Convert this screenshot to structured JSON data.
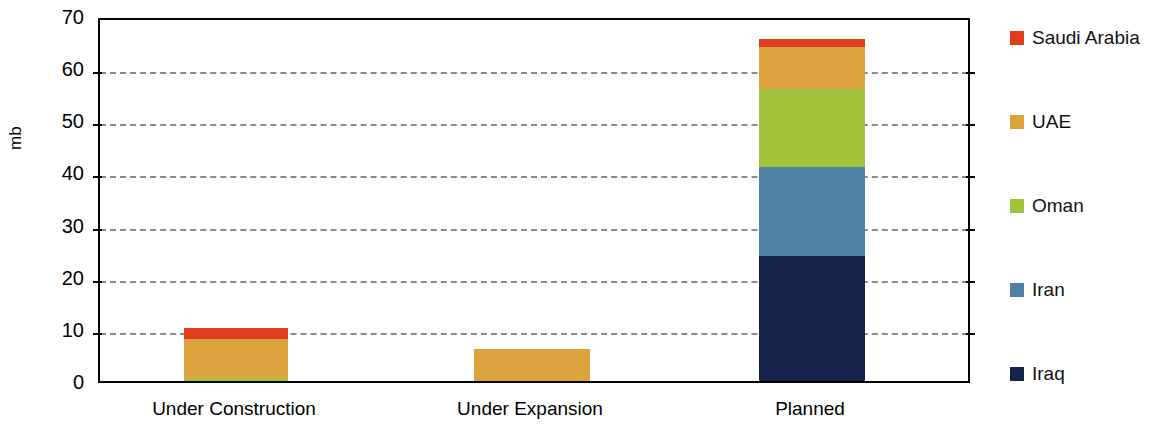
{
  "chart_data": {
    "type": "bar",
    "subtype": "stacked-vertical",
    "title": "",
    "xlabel": "",
    "ylabel": "mb",
    "ylim": [
      0,
      70
    ],
    "yticks": [
      0,
      10,
      20,
      30,
      40,
      50,
      60,
      70
    ],
    "grid": true,
    "grid_style": "dashed-horizontal",
    "legend_position": "right",
    "categories": [
      "Under Construction",
      "Under Expansion",
      "Planned"
    ],
    "series": [
      {
        "name": "Iraq",
        "color": "#152449",
        "values": [
          0,
          0,
          24
        ]
      },
      {
        "name": "Iran",
        "color": "#4f81a6",
        "values": [
          0,
          0,
          17
        ]
      },
      {
        "name": "Oman",
        "color": "#a3c23c",
        "values": [
          0.5,
          0,
          15
        ]
      },
      {
        "name": "UAE",
        "color": "#dca23c",
        "values": [
          7.5,
          6.2,
          8
        ]
      },
      {
        "name": "Saudi Arabia",
        "color": "#e03c1e",
        "values": [
          2.2,
          0,
          1.5
        ]
      }
    ],
    "totals": [
      10.2,
      6.2,
      65.5
    ],
    "legend_order": [
      "Saudi Arabia",
      "UAE",
      "Oman",
      "Iran",
      "Iraq"
    ]
  },
  "axis": {
    "y_label": "mb",
    "ticks": [
      "70",
      "60",
      "50",
      "40",
      "30",
      "20",
      "10",
      "0"
    ]
  },
  "legend": {
    "items": [
      {
        "label": "Saudi Arabia",
        "color": "#e03c1e"
      },
      {
        "label": "UAE",
        "color": "#dca23c"
      },
      {
        "label": "Oman",
        "color": "#a3c23c"
      },
      {
        "label": "Iran",
        "color": "#4f81a6"
      },
      {
        "label": "Iraq",
        "color": "#152449"
      }
    ]
  },
  "categories": [
    {
      "label": "Under Construction"
    },
    {
      "label": "Under Expansion"
    },
    {
      "label": "Planned"
    }
  ]
}
